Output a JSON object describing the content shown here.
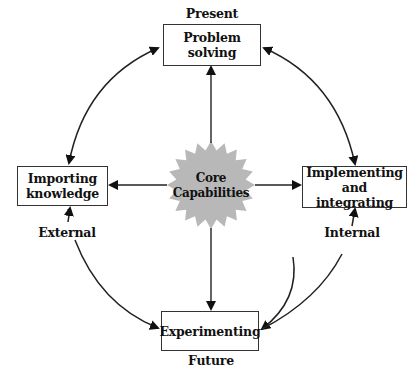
{
  "diagram": {
    "type": "cycle-diagram",
    "center": {
      "label_line1": "Core",
      "label_line2": "Capabilities",
      "shape": "starburst",
      "fill": "#b8b8b8"
    },
    "nodes": {
      "top": {
        "line1": "Problem",
        "line2": "solving"
      },
      "left": {
        "line1": "Importing",
        "line2": "knowledge"
      },
      "right": {
        "line1": "Implementing",
        "line2": "and integrating"
      },
      "bottom": {
        "line1": "Experimenting"
      }
    },
    "axis_labels": {
      "top": "Present",
      "bottom": "Future",
      "left": "External",
      "right": "Internal"
    },
    "connections": [
      {
        "from": "center",
        "to": "top",
        "style": "straight-arrow"
      },
      {
        "from": "center",
        "to": "left",
        "style": "straight-arrow"
      },
      {
        "from": "center",
        "to": "right",
        "style": "straight-arrow"
      },
      {
        "from": "center",
        "to": "bottom",
        "style": "straight-arrow"
      },
      {
        "from": "top",
        "to": "left",
        "style": "curved-double-arrow"
      },
      {
        "from": "top",
        "to": "right",
        "style": "curved-double-arrow"
      },
      {
        "from": "left",
        "to": "bottom",
        "style": "curved-double-arrow"
      },
      {
        "from": "right",
        "to": "bottom",
        "style": "curved-double-arrow"
      }
    ],
    "colors": {
      "line": "#222222",
      "box_border": "#333333",
      "star": "#b8b8b8",
      "background": "#ffffff"
    }
  }
}
